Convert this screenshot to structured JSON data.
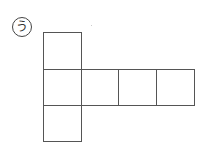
{
  "figure": {
    "label": "う",
    "squares": [
      {
        "id": "left-top",
        "x": 43,
        "y": 32,
        "w": 39,
        "h": 38
      },
      {
        "id": "left-middle",
        "x": 43,
        "y": 69,
        "w": 39,
        "h": 37
      },
      {
        "id": "left-bottom",
        "x": 43,
        "y": 105,
        "w": 39,
        "h": 37
      },
      {
        "id": "row-2",
        "x": 81,
        "y": 69,
        "w": 38,
        "h": 37
      },
      {
        "id": "row-3",
        "x": 118,
        "y": 69,
        "w": 39,
        "h": 37
      },
      {
        "id": "row-4",
        "x": 156,
        "y": 69,
        "w": 39,
        "h": 37
      }
    ],
    "line_color": "#555555"
  }
}
